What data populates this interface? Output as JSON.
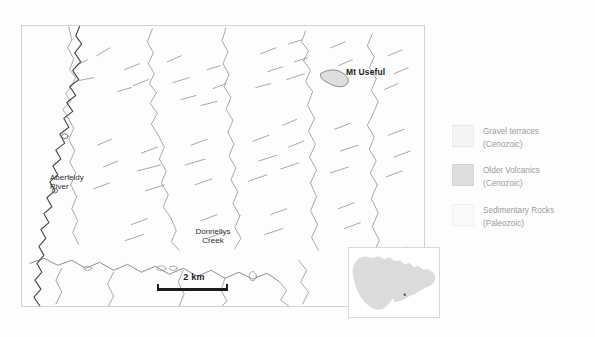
{
  "figure": {
    "name": "geological-locality-map",
    "background_color": "#fdfdfd"
  },
  "map": {
    "frame_border_color": "#d2d2d2",
    "labels": {
      "peak": "Mt Useful",
      "river": "Aberfeldy\nRiver",
      "creek": "Donnellys\nCreek"
    },
    "scalebar": {
      "label": "2 km",
      "length_km": 2
    }
  },
  "inset": {
    "name": "victoria-state-inset",
    "fill_color": "#dcdcdc",
    "marker_color": "#555555"
  },
  "legend": {
    "items": [
      {
        "label": "Gravel terraces\n(Cenozoic)",
        "unit": "Gravel terraces",
        "age": "(Cenozoic)",
        "color": "#f4f4f4"
      },
      {
        "label": "Older Volcanics\n(Cenozoic)",
        "unit": "Older Volcanics",
        "age": "(Cenozoic)",
        "color": "#dedede"
      },
      {
        "label": "Sedimentary Rocks\n(Paleozoic)",
        "unit": "Sedimentary Rocks",
        "age": "(Paleozoic)",
        "color": "#fafafa"
      }
    ],
    "text_color": "#9b9b9b"
  }
}
